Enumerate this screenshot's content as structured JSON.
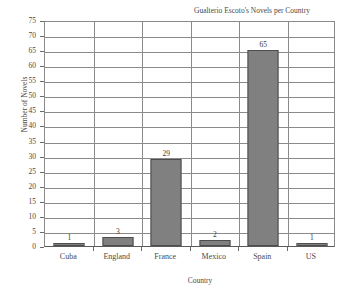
{
  "chart_data": {
    "type": "bar",
    "title": "Gualterio Escoto's Novels per Country",
    "xlabel": "Country",
    "ylabel": "Number of Novels",
    "categories": [
      "Cuba",
      "England",
      "France",
      "Mexico",
      "Spain",
      "US"
    ],
    "values": [
      1,
      3,
      29,
      2,
      65,
      1
    ],
    "data_labels": [
      "1",
      "3",
      "29",
      "2",
      "65",
      "1"
    ],
    "ylim": [
      0,
      75
    ],
    "ytick_step": 5,
    "ytick_labels": [
      "75",
      "70",
      "65",
      "60",
      "55",
      "50",
      "45",
      "40",
      "35",
      "30",
      "25",
      "20",
      "15",
      "10",
      "5",
      "0"
    ],
    "grid": {
      "horizontal": true,
      "vertical": true
    },
    "legend": null,
    "legend_position": "none",
    "series": [
      {
        "name": "Number of Novels",
        "values": [
          1,
          3,
          29,
          2,
          65,
          1
        ]
      }
    ],
    "colors": {
      "bar_fill": "#808080",
      "bar_border": "#4d4d4d",
      "grid_line": "#8a8a8a",
      "axis_line": "#5a5a5a",
      "text": "#4a4a4a",
      "background": "#ffffff"
    }
  }
}
